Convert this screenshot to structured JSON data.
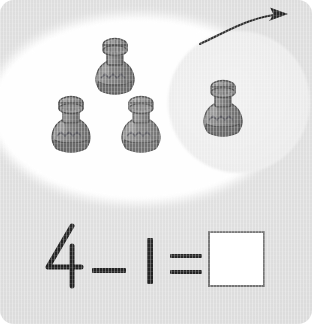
{
  "worksheet": {
    "type": "subtraction-picture-problem",
    "background_color": "#dcdcdc",
    "title": "Subtraction with objects",
    "object_name": "bottle",
    "total_objects": 4,
    "removed_objects": 1,
    "group_oval_color": "#fdfdfd",
    "subset_circle_color": "#eaeaea"
  },
  "arrow": {
    "name": "take-away-arrow",
    "direction": "curved-up-right",
    "color": "#1a1a1a",
    "meaning": "remove from group"
  },
  "objects": [
    {
      "label": "bottle-1",
      "position": "top-center",
      "in_subset": false
    },
    {
      "label": "bottle-2",
      "position": "left",
      "in_subset": false
    },
    {
      "label": "bottle-3",
      "position": "center",
      "in_subset": false
    },
    {
      "label": "bottle-4",
      "position": "right-inside-circle",
      "in_subset": true
    }
  ],
  "bottle_style": {
    "cap_color": "#8f8f8f",
    "body_color": "#6f6f6f",
    "base_color": "#5a5a5a",
    "outline_color": "#3d3d3d",
    "band_pattern": "zigzag"
  },
  "equation": {
    "minuend": "4",
    "operator_minus": "−",
    "subtrahend": "1",
    "operator_equals": "=",
    "answer": "",
    "answer_placeholder": "",
    "text": "4 − 1 =",
    "text_color": "#141414",
    "answer_box_border_color": "#6f6f6f",
    "answer_box_fill": "#ffffff"
  }
}
